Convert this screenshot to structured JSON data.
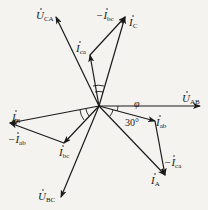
{
  "diagram": {
    "type": "phasor-diagram",
    "origin": [
      99,
      106
    ],
    "phasors": [
      {
        "id": "U_AB",
        "symbol": "U",
        "sub": "AB",
        "prefix": "",
        "end": [
          200,
          106
        ]
      },
      {
        "id": "U_CA",
        "symbol": "U",
        "sub": "CA",
        "prefix": "",
        "end": [
          56,
          17
        ]
      },
      {
        "id": "U_BC",
        "symbol": "U",
        "sub": "BC",
        "prefix": "",
        "end": [
          61,
          197
        ]
      },
      {
        "id": "I_C",
        "symbol": "I",
        "sub": "C",
        "prefix": "",
        "end": [
          125,
          17
        ]
      },
      {
        "id": "I_ca",
        "symbol": "I",
        "sub": "ca",
        "prefix": "",
        "end": [
          90,
          55
        ]
      },
      {
        "id": "-I_bc",
        "symbol": "I",
        "sub": "bc",
        "prefix": "−",
        "from": [
          90,
          55
        ],
        "end": [
          125,
          17
        ]
      },
      {
        "id": "I_B",
        "symbol": "I",
        "sub": "B",
        "prefix": "",
        "end": [
          10,
          123
        ]
      },
      {
        "id": "I_bc",
        "symbol": "I",
        "sub": "bc",
        "prefix": "",
        "end": [
          64,
          143
        ]
      },
      {
        "id": "-I_ab",
        "symbol": "I",
        "sub": "ab",
        "prefix": "−",
        "from": [
          64,
          143
        ],
        "end": [
          10,
          123
        ]
      },
      {
        "id": "I_ab",
        "symbol": "I",
        "sub": "ab",
        "prefix": "",
        "end": [
          155,
          121
        ]
      },
      {
        "id": "I_A",
        "symbol": "I",
        "sub": "A",
        "prefix": "",
        "end": [
          165,
          175
        ]
      },
      {
        "id": "-I_ca",
        "symbol": "I",
        "sub": "ca",
        "prefix": "−",
        "from": [
          155,
          121
        ],
        "end": [
          165,
          175
        ]
      }
    ],
    "labels": {
      "u_ca": {
        "sym": "U",
        "sub": "CA",
        "pre": ""
      },
      "u_ab": {
        "sym": "U",
        "sub": "AB",
        "pre": ""
      },
      "u_bc": {
        "sym": "U",
        "sub": "BC",
        "pre": ""
      },
      "i_c": {
        "sym": "I",
        "sub": "C",
        "pre": ""
      },
      "neg_i_bc": {
        "sym": "I",
        "sub": "bc",
        "pre": "−"
      },
      "i_ca": {
        "sym": "I",
        "sub": "ca",
        "pre": ""
      },
      "i_b": {
        "sym": "I",
        "sub": "B",
        "pre": ""
      },
      "neg_i_ab": {
        "sym": "I",
        "sub": "ab",
        "pre": "−"
      },
      "i_bc": {
        "sym": "I",
        "sub": "bc",
        "pre": ""
      },
      "i_ab": {
        "sym": "I",
        "sub": "ab",
        "pre": ""
      },
      "i_a": {
        "sym": "I",
        "sub": "A",
        "pre": ""
      },
      "neg_i_ca": {
        "sym": "I",
        "sub": "ca",
        "pre": "−"
      }
    },
    "angles": {
      "phi": "φ",
      "thirty": "30°"
    },
    "colors": {
      "stroke": "#1a1a1a",
      "background": "#f4f3f0"
    }
  }
}
